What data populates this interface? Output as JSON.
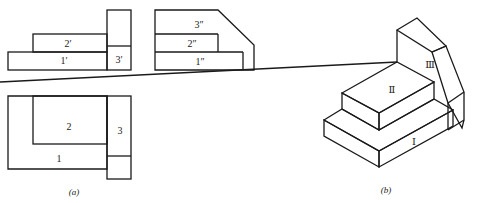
{
  "figure_a": {
    "caption": "(a)",
    "front_view": {
      "labels": {
        "block1": "1′",
        "block2": "2′",
        "block3": "3′"
      }
    },
    "side_view": {
      "labels": {
        "block1": "1″",
        "block2": "2″",
        "block3": "3″"
      }
    },
    "top_view": {
      "labels": {
        "block1": "1",
        "block2": "2",
        "block3": "3"
      }
    }
  },
  "figure_b": {
    "caption": "(b)",
    "labels": {
      "block1": "Ⅰ",
      "block2": "Ⅱ",
      "block3": "Ⅲ"
    }
  },
  "colors": {
    "line": "#1a1a1a",
    "background": "#ffffff"
  }
}
